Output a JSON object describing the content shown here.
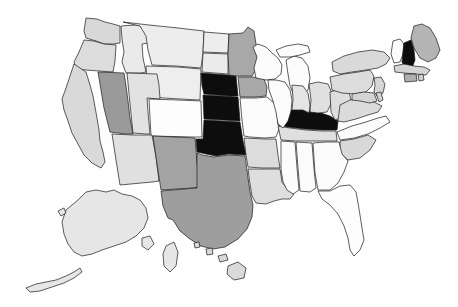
{
  "map": {
    "title": "United States Choropleth Map",
    "type": "choropleth",
    "projection": "albers-usa",
    "background_color": "#fefefe",
    "border_color": "#1a1a1a",
    "legend_shown": false,
    "labels_shown": false,
    "shade_levels": {
      "black": "#0d0d0d",
      "medium_gray": "#9a9a9a",
      "light_gray": "#d8d8d8",
      "very_light_gray": "#ececec",
      "white": "#fdfdfd"
    },
    "highlighted_states": [
      "Nebraska",
      "Kansas",
      "Oklahoma",
      "Illinois",
      "New Hampshire"
    ],
    "states": [
      {
        "name": "Washington",
        "abbr": "WA",
        "shade": "light_gray",
        "fill": "#d8d8d8"
      },
      {
        "name": "Oregon",
        "abbr": "OR",
        "shade": "light_gray",
        "fill": "#dcdcdc"
      },
      {
        "name": "California",
        "abbr": "CA",
        "shade": "light_gray",
        "fill": "#d9d9d9"
      },
      {
        "name": "Nevada",
        "abbr": "NV",
        "shade": "medium_gray",
        "fill": "#9a9a9a"
      },
      {
        "name": "Idaho",
        "abbr": "ID",
        "shade": "very_light_gray",
        "fill": "#eaeaea"
      },
      {
        "name": "Montana",
        "abbr": "MT",
        "shade": "very_light_gray",
        "fill": "#ededed"
      },
      {
        "name": "Wyoming",
        "abbr": "WY",
        "shade": "very_light_gray",
        "fill": "#eeeeee"
      },
      {
        "name": "Utah",
        "abbr": "UT",
        "shade": "light_gray",
        "fill": "#e2e2e2"
      },
      {
        "name": "Colorado",
        "abbr": "CO",
        "shade": "white",
        "fill": "#fdfdfd"
      },
      {
        "name": "Arizona",
        "abbr": "AZ",
        "shade": "light_gray",
        "fill": "#e0e0e0"
      },
      {
        "name": "New Mexico",
        "abbr": "NM",
        "shade": "medium_gray",
        "fill": "#a3a3a3"
      },
      {
        "name": "North Dakota",
        "abbr": "ND",
        "shade": "very_light_gray",
        "fill": "#ededed"
      },
      {
        "name": "South Dakota",
        "abbr": "SD",
        "shade": "very_light_gray",
        "fill": "#ebebeb"
      },
      {
        "name": "Nebraska",
        "abbr": "NE",
        "shade": "black",
        "fill": "#0d0d0d"
      },
      {
        "name": "Kansas",
        "abbr": "KS",
        "shade": "black",
        "fill": "#0d0d0d"
      },
      {
        "name": "Oklahoma",
        "abbr": "OK",
        "shade": "black",
        "fill": "#0d0d0d"
      },
      {
        "name": "Texas",
        "abbr": "TX",
        "shade": "medium_gray",
        "fill": "#9e9e9e"
      },
      {
        "name": "Minnesota",
        "abbr": "MN",
        "shade": "medium_gray",
        "fill": "#a8a8a8"
      },
      {
        "name": "Iowa",
        "abbr": "IA",
        "shade": "medium_gray",
        "fill": "#a8a8a8"
      },
      {
        "name": "Missouri",
        "abbr": "MO",
        "shade": "white",
        "fill": "#fbfbfb"
      },
      {
        "name": "Arkansas",
        "abbr": "AR",
        "shade": "white",
        "fill": "#fbfbfb"
      },
      {
        "name": "Louisiana",
        "abbr": "LA",
        "shade": "light_gray",
        "fill": "#dcdcdc"
      },
      {
        "name": "Mississippi",
        "abbr": "MS",
        "shade": "light_gray",
        "fill": "#dedede"
      },
      {
        "name": "Alabama",
        "abbr": "AL",
        "shade": "white",
        "fill": "#fcfcfc"
      },
      {
        "name": "Tennessee",
        "abbr": "TN",
        "shade": "white",
        "fill": "#fbfbfb"
      },
      {
        "name": "Kentucky",
        "abbr": "KY",
        "shade": "light_gray",
        "fill": "#dfdfdf"
      },
      {
        "name": "Illinois",
        "abbr": "IL",
        "shade": "black",
        "fill": "#0d0d0d"
      },
      {
        "name": "Wisconsin",
        "abbr": "WI",
        "shade": "white",
        "fill": "#fbfbfb"
      },
      {
        "name": "Michigan",
        "abbr": "MI",
        "shade": "white",
        "fill": "#fcfcfc"
      },
      {
        "name": "Indiana",
        "abbr": "IN",
        "shade": "light_gray",
        "fill": "#e4e4e4"
      },
      {
        "name": "Ohio",
        "abbr": "OH",
        "shade": "light_gray",
        "fill": "#e0e0e0"
      },
      {
        "name": "West Virginia",
        "abbr": "WV",
        "shade": "light_gray",
        "fill": "#dedede"
      },
      {
        "name": "Virginia",
        "abbr": "VA",
        "shade": "light_gray",
        "fill": "#dbdbdb"
      },
      {
        "name": "North Carolina",
        "abbr": "NC",
        "shade": "white",
        "fill": "#fbfbfb"
      },
      {
        "name": "South Carolina",
        "abbr": "SC",
        "shade": "light_gray",
        "fill": "#d8d8d8"
      },
      {
        "name": "Georgia",
        "abbr": "GA",
        "shade": "white",
        "fill": "#fcfcfc"
      },
      {
        "name": "Florida",
        "abbr": "FL",
        "shade": "white",
        "fill": "#fdfdfd"
      },
      {
        "name": "Pennsylvania",
        "abbr": "PA",
        "shade": "light_gray",
        "fill": "#dcdcdc"
      },
      {
        "name": "New York",
        "abbr": "NY",
        "shade": "light_gray",
        "fill": "#d9d9d9"
      },
      {
        "name": "Maine",
        "abbr": "ME",
        "shade": "medium_gray",
        "fill": "#b4b4b4"
      },
      {
        "name": "Vermont",
        "abbr": "VT",
        "shade": "white",
        "fill": "#fbfbfb"
      },
      {
        "name": "New Hampshire",
        "abbr": "NH",
        "shade": "black",
        "fill": "#0d0d0d"
      },
      {
        "name": "Massachusetts",
        "abbr": "MA",
        "shade": "light_gray",
        "fill": "#d4d4d4"
      },
      {
        "name": "Rhode Island",
        "abbr": "RI",
        "shade": "light_gray",
        "fill": "#d0d0d0"
      },
      {
        "name": "Connecticut",
        "abbr": "CT",
        "shade": "medium_gray",
        "fill": "#b0b0b0"
      },
      {
        "name": "New Jersey",
        "abbr": "NJ",
        "shade": "light_gray",
        "fill": "#d6d6d6"
      },
      {
        "name": "Delaware",
        "abbr": "DE",
        "shade": "light_gray",
        "fill": "#d2d2d2"
      },
      {
        "name": "Maryland",
        "abbr": "MD",
        "shade": "light_gray",
        "fill": "#d4d4d4"
      },
      {
        "name": "Alaska",
        "abbr": "AK",
        "shade": "light_gray",
        "fill": "#e6e6e6"
      },
      {
        "name": "Hawaii",
        "abbr": "HI",
        "shade": "light_gray",
        "fill": "#dadada"
      }
    ]
  }
}
